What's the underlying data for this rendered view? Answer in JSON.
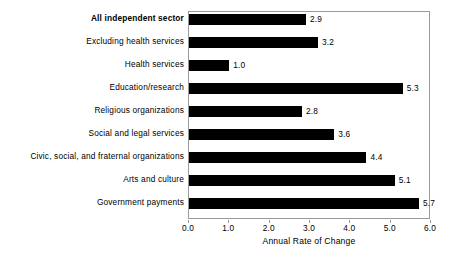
{
  "chart_data": {
    "type": "bar",
    "orientation": "horizontal",
    "title": "",
    "xlabel": "Annual Rate of Change",
    "ylabel": "",
    "xlim": [
      0.0,
      6.0
    ],
    "xticks": [
      "0.0",
      "1.0",
      "2.0",
      "3.0",
      "4.0",
      "5.0",
      "6.0"
    ],
    "xtick_values": [
      0.0,
      1.0,
      2.0,
      3.0,
      4.0,
      5.0,
      6.0
    ],
    "grid": false,
    "legend": null,
    "bar_color": "#000000",
    "frame_color": "#9a9a9a",
    "background_color": "#ffffff",
    "categories": [
      "All independent sector",
      "Excluding health services",
      "Health services",
      "Education/research",
      "Religious organizations",
      "Social and legal services",
      "Civic, social, and fraternal organizations",
      "Arts and culture",
      "Government payments"
    ],
    "values": [
      2.9,
      3.2,
      1.0,
      5.3,
      2.8,
      3.6,
      4.4,
      5.1,
      5.7
    ],
    "value_labels": [
      "2.9",
      "3.2",
      "1.0",
      "5.3",
      "2.8",
      "3.6",
      "4.4",
      "5.1",
      "5.7"
    ],
    "emphasized_categories": [
      "All independent sector"
    ]
  }
}
